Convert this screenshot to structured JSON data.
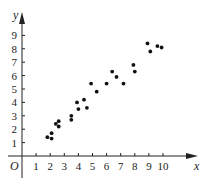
{
  "chart_data": {
    "type": "scatter",
    "title": "",
    "xlabel": "x",
    "ylabel": "y",
    "origin_label": "O",
    "xlim": [
      0,
      11
    ],
    "ylim": [
      0,
      10
    ],
    "grid": false,
    "legend": null,
    "x_ticks": [
      "1",
      "2",
      "3",
      "4",
      "5",
      "6",
      "7",
      "8",
      "9",
      "10"
    ],
    "y_ticks": [
      "1",
      "2",
      "3",
      "4",
      "5",
      "6",
      "7",
      "8",
      "9"
    ],
    "points": [
      {
        "x": 1.8,
        "y": 1.4
      },
      {
        "x": 2.1,
        "y": 1.3
      },
      {
        "x": 2.1,
        "y": 1.7
      },
      {
        "x": 2.4,
        "y": 2.4
      },
      {
        "x": 2.6,
        "y": 2.6
      },
      {
        "x": 2.6,
        "y": 2.2
      },
      {
        "x": 3.5,
        "y": 3.0
      },
      {
        "x": 3.5,
        "y": 2.7
      },
      {
        "x": 3.9,
        "y": 4.0
      },
      {
        "x": 4.0,
        "y": 3.5
      },
      {
        "x": 4.4,
        "y": 4.2
      },
      {
        "x": 4.6,
        "y": 3.6
      },
      {
        "x": 4.9,
        "y": 5.4
      },
      {
        "x": 5.3,
        "y": 4.8
      },
      {
        "x": 6.0,
        "y": 5.4
      },
      {
        "x": 6.4,
        "y": 6.3
      },
      {
        "x": 6.7,
        "y": 5.9
      },
      {
        "x": 7.2,
        "y": 5.4
      },
      {
        "x": 7.9,
        "y": 6.8
      },
      {
        "x": 8.0,
        "y": 6.3
      },
      {
        "x": 8.9,
        "y": 8.4
      },
      {
        "x": 9.1,
        "y": 7.8
      },
      {
        "x": 9.6,
        "y": 8.2
      },
      {
        "x": 9.9,
        "y": 8.1
      }
    ]
  },
  "colors": {
    "axis": "#222222",
    "point": "#111111"
  }
}
